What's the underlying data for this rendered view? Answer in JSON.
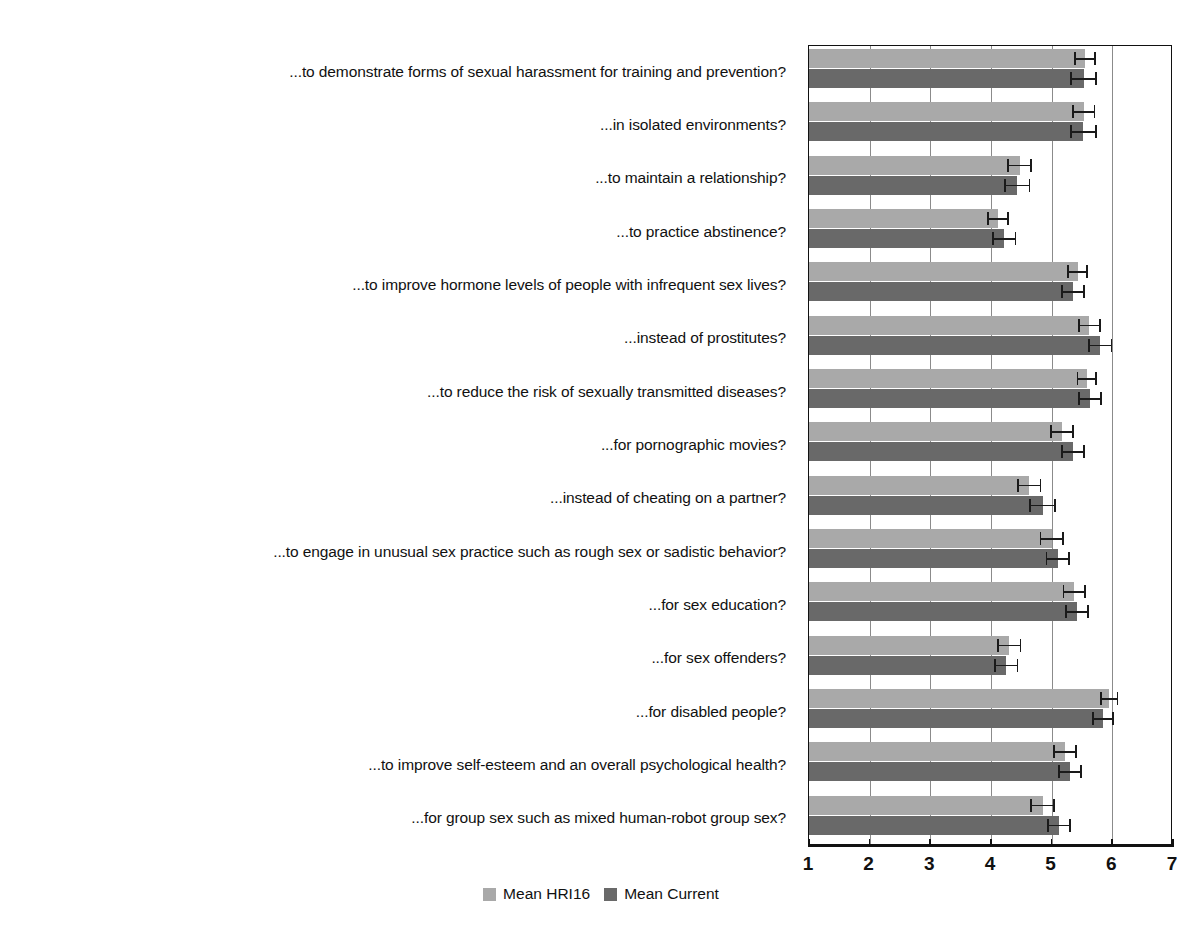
{
  "chart_data": {
    "type": "bar",
    "orientation": "horizontal",
    "title": "",
    "subtitle": "",
    "xlabel": "",
    "ylabel": "",
    "xlim": [
      1,
      7
    ],
    "xticks": [
      1,
      2,
      3,
      4,
      5,
      6,
      7
    ],
    "xticklabels": [
      "1",
      "2",
      "3",
      "4",
      "5",
      "6",
      "7"
    ],
    "grid": true,
    "grid_axis": "x",
    "legend_position": "bottom",
    "categories": [
      "...to demonstrate forms of sexual harassment for training and prevention?",
      "...in isolated environments?",
      "...to maintain a relationship?",
      "...to practice abstinence?",
      "...to improve hormone levels of people with infrequent sex lives?",
      "...instead of prostitutes?",
      "...to reduce the risk of sexually transmitted diseases?",
      "...for pornographic movies?",
      "...instead of cheating on a partner?",
      "...to engage in unusual sex practice such as rough sex or sadistic behavior?",
      "...for sex education?",
      "...for sex offenders?",
      "...for disabled people?",
      "...to improve self-esteem and an overall psychological health?",
      "...for group sex such as mixed human-robot group sex?"
    ],
    "series": [
      {
        "name": "Mean HRI16",
        "color": "#a9a9a9",
        "values": [
          5.55,
          5.53,
          4.47,
          4.12,
          5.43,
          5.62,
          5.58,
          5.17,
          4.63,
          5.0,
          5.37,
          4.3,
          5.95,
          5.22,
          4.85
        ],
        "errors": [
          0.18,
          0.19,
          0.2,
          0.18,
          0.17,
          0.19,
          0.17,
          0.2,
          0.2,
          0.2,
          0.19,
          0.2,
          0.15,
          0.19,
          0.2
        ]
      },
      {
        "name": "Mean Current",
        "color": "#696969",
        "values": [
          5.53,
          5.52,
          4.43,
          4.22,
          5.35,
          5.8,
          5.63,
          5.35,
          4.85,
          5.1,
          5.42,
          4.25,
          5.85,
          5.3,
          5.12
        ],
        "errors": [
          0.22,
          0.22,
          0.22,
          0.2,
          0.2,
          0.2,
          0.2,
          0.2,
          0.22,
          0.2,
          0.2,
          0.2,
          0.18,
          0.2,
          0.2
        ]
      }
    ]
  },
  "legend": {
    "entries": [
      {
        "label": "Mean HRI16",
        "color": "#a9a9a9"
      },
      {
        "label": "Mean Current",
        "color": "#696969"
      }
    ]
  }
}
